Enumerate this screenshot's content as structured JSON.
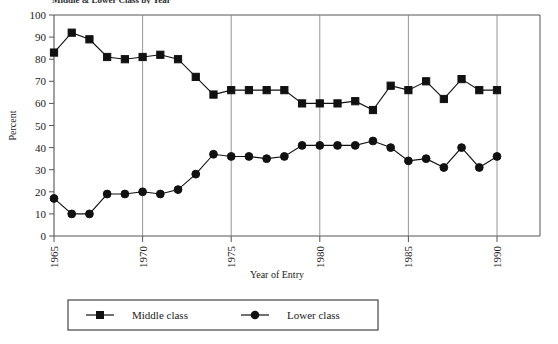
{
  "title": "Middle & Lower Class by Year",
  "chart_data": {
    "type": "line",
    "title": "Middle & Lower Class by Year",
    "xlabel": "Year of Entry",
    "ylabel": "Percent",
    "xlim": [
      1964.5,
      1990.5
    ],
    "ylim": [
      0,
      100
    ],
    "ytick_step": 10,
    "yticks": [
      0,
      10,
      20,
      30,
      40,
      50,
      60,
      70,
      80,
      90,
      100
    ],
    "xticks": [
      1965,
      1970,
      1975,
      1980,
      1985,
      1990
    ],
    "grid": "vertical-at-xticks",
    "legend_position": "bottom",
    "x": [
      1965,
      1966,
      1967,
      1968,
      1969,
      1970,
      1971,
      1972,
      1973,
      1974,
      1975,
      1976,
      1977,
      1978,
      1979,
      1980,
      1981,
      1982,
      1983,
      1984,
      1985,
      1986,
      1987,
      1988,
      1989,
      1990
    ],
    "series": [
      {
        "name": "Middle class",
        "marker": "square",
        "color": "#111111",
        "values": [
          83,
          92,
          89,
          81,
          80,
          81,
          82,
          80,
          72,
          64,
          66,
          66,
          66,
          66,
          60,
          60,
          60,
          61,
          57,
          68,
          66,
          70,
          62,
          71,
          66,
          66
        ]
      },
      {
        "name": "Lower class",
        "marker": "circle",
        "color": "#111111",
        "values": [
          17,
          10,
          10,
          19,
          19,
          20,
          19,
          21,
          28,
          37,
          36,
          36,
          35,
          36,
          41,
          41,
          41,
          41,
          43,
          40,
          34,
          35,
          31,
          40,
          31,
          36
        ]
      }
    ]
  },
  "legend": {
    "items": [
      {
        "label": "Middle class",
        "marker": "square"
      },
      {
        "label": "Lower class",
        "marker": "circle"
      }
    ]
  }
}
